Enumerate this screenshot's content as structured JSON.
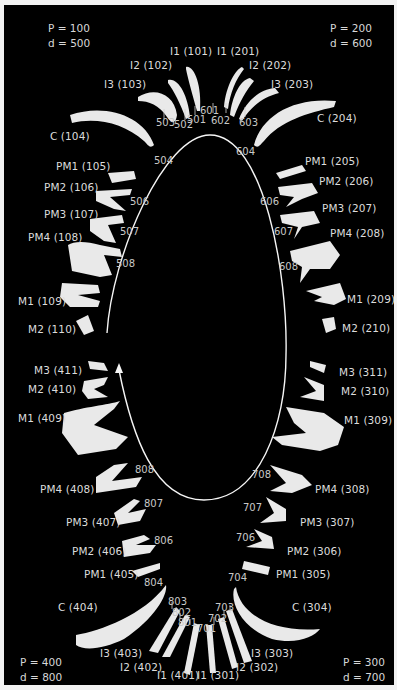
{
  "quadrants": {
    "upper_right": {
      "P": "P = 100",
      "d": "d = 500"
    },
    "upper_left": {
      "P": "P = 200",
      "d": "d = 600"
    },
    "lower_left": {
      "P": "P = 300",
      "d": "d = 700"
    },
    "lower_right": {
      "P": "P = 400",
      "d": "d = 800"
    }
  },
  "upper_left_side_labels": {
    "I1": "I1 (101)",
    "I2": "I2 (102)",
    "I3": "I3 (103)",
    "C": "C (104)",
    "PM1": "PM1 (105)",
    "PM2": "PM2 (106)",
    "PM3": "PM3 (107)",
    "PM4": "PM4 (108)",
    "M1": "M1 (109)",
    "M2": "M2 (110)"
  },
  "upper_right_side_labels": {
    "I1": "I1 (201)",
    "I2": "I2 (202)",
    "I3": "I3 (203)",
    "C": "C (204)",
    "PM1": "PM1 (205)",
    "PM2": "PM2 (206)",
    "PM3": "PM3 (207)",
    "PM4": "PM4 (208)",
    "M1": "M1 (209)",
    "M2": "M2 (210)"
  },
  "lower_right_side_labels": {
    "I1": "I1 (301)",
    "I2": "I2 (302)",
    "I3": "I3 (303)",
    "C": "C (304)",
    "PM1": "PM1 (305)",
    "PM2": "PM2 (306)",
    "PM3": "PM3 (307)",
    "PM4": "PM4 (308)",
    "M1": "M1 (309)",
    "M2": "M2 (310)",
    "M3": "M3 (311)"
  },
  "lower_left_side_labels": {
    "I1": "I1 (401)",
    "I2": "I2 (402)",
    "I3": "I3 (403)",
    "C": "C (404)",
    "PM1": "PM1 (405)",
    "PM2": "PM2 (406)",
    "PM3": "PM3 (407)",
    "PM4": "PM4 (408)",
    "M1": "M1 (409)",
    "M2": "M2 (410)",
    "M3": "M3 (411)"
  },
  "deciduous": {
    "q5": [
      "501",
      "502",
      "503",
      "504",
      "506",
      "507",
      "508"
    ],
    "q6": [
      "601",
      "602",
      "603",
      "604",
      "606",
      "607",
      "608"
    ],
    "q7": [
      "701",
      "702",
      "703",
      "704",
      "706",
      "707",
      "708"
    ],
    "q8": [
      "801",
      "802",
      "803",
      "804",
      "806",
      "807",
      "808"
    ]
  },
  "colors": {
    "background": "#000000",
    "border": "#f2f2f2",
    "tooth": "#e9e9e9",
    "text": "#dcdcdc"
  }
}
